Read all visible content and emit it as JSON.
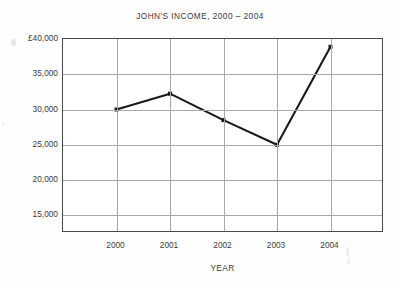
{
  "chart_data": {
    "type": "line",
    "title": "JOHN'S INCOME, 2000 – 2004",
    "xlabel": "YEAR",
    "ylabel": "",
    "categories": [
      "2000",
      "2001",
      "2002",
      "2003",
      "2004"
    ],
    "x": [
      2000,
      2001,
      2002,
      2003,
      2004
    ],
    "values": [
      30000,
      32250,
      28500,
      25000,
      38900
    ],
    "series": [
      {
        "name": "John's income",
        "values": [
          30000,
          32250,
          28500,
          25000,
          38900
        ]
      }
    ],
    "ylim": [
      12500,
      40000
    ],
    "yticks": [
      40000,
      35000,
      30000,
      25000,
      20000,
      15000
    ],
    "ytick_labels": [
      "£40,000",
      "35,000",
      "30,000",
      "25,000",
      "20,000",
      "15,000"
    ],
    "xtick_labels": [
      "2000",
      "2001",
      "2002",
      "2003",
      "2004"
    ],
    "grid": true,
    "legend": false,
    "legend_position": "none",
    "currency": "£",
    "marker": "square",
    "line_color": "#1a1a1a",
    "grid_color": "#a8a8a8",
    "axis_color": "#4a4a4a",
    "background_color": "#ffffff"
  },
  "chart": {
    "title": "JOHN'S INCOME, 2000 – 2004",
    "x_axis_title": "YEAR"
  }
}
